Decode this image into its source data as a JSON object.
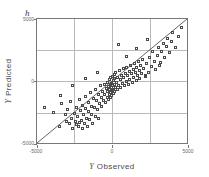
{
  "figure": {
    "panel_label": "h",
    "background_color": "#ffffff",
    "frame_color": "#777777",
    "grid_color": "#b9b9b9",
    "marker_color": "#4a4a4a",
    "line_color": "#3a3a3a"
  },
  "chart_data": {
    "type": "scatter",
    "title": "",
    "subtitle": "",
    "panel_label": "h",
    "xlabel": "Y Observed",
    "ylabel": "Y Predicted",
    "xlabel_variable": "Y",
    "xlabel_text": "Observed",
    "ylabel_variable": "Y",
    "ylabel_text": "Predicted",
    "xlim": [
      -5000,
      5000
    ],
    "ylim": [
      -5000,
      5000
    ],
    "xticks": [
      -5000,
      0,
      5000
    ],
    "yticks": [
      -5000,
      0,
      5000
    ],
    "xtick_labels": [
      "-5000",
      "0",
      "5000"
    ],
    "ytick_labels": [
      "-5000",
      "0",
      "5000"
    ],
    "grid": true,
    "gridlines_x": [
      -2500,
      0,
      2500
    ],
    "gridlines_y": [
      -2500,
      0,
      2500
    ],
    "legend": null,
    "legend_position": "none",
    "marker": "open-square",
    "reference_line": {
      "name": "one-to-one-line",
      "type": "identity",
      "slope": 1,
      "intercept": 0,
      "from": [
        -5000,
        -5000
      ],
      "to": [
        5000,
        5000
      ]
    },
    "series": [
      {
        "name": "observations",
        "points": [
          [
            -4450,
            -2100
          ],
          [
            -3850,
            -2450
          ],
          [
            -3500,
            -3550
          ],
          [
            -3350,
            -1750
          ],
          [
            -3100,
            -2600
          ],
          [
            -3050,
            -3150
          ],
          [
            -2950,
            -2200
          ],
          [
            -2800,
            -3350
          ],
          [
            -2750,
            -1600
          ],
          [
            -2700,
            -2900
          ],
          [
            -2600,
            -3700
          ],
          [
            -2500,
            -2500
          ],
          [
            -2450,
            -3150
          ],
          [
            -2400,
            -2050
          ],
          [
            -2350,
            -3450
          ],
          [
            -2300,
            -2750
          ],
          [
            -2250,
            -3600
          ],
          [
            -2200,
            -1450
          ],
          [
            -2150,
            -3250
          ],
          [
            -2100,
            -2300
          ],
          [
            -2050,
            -3100
          ],
          [
            -2000,
            -3700
          ],
          [
            -1950,
            -1900
          ],
          [
            -1900,
            -2600
          ],
          [
            -1850,
            -3350
          ],
          [
            -1800,
            -1200
          ],
          [
            -1750,
            -2150
          ],
          [
            -1700,
            -2900
          ],
          [
            -1650,
            -3550
          ],
          [
            -1600,
            -1700
          ],
          [
            -1550,
            -2400
          ],
          [
            -1500,
            -3050
          ],
          [
            -1450,
            -900
          ],
          [
            -1400,
            -1950
          ],
          [
            -1350,
            -2600
          ],
          [
            -1300,
            -3300
          ],
          [
            -1250,
            -1350
          ],
          [
            -1200,
            -2050
          ],
          [
            -1150,
            -2750
          ],
          [
            -1100,
            -600
          ],
          [
            -1050,
            -1500
          ],
          [
            -1000,
            -2200
          ],
          [
            -950,
            -2900
          ],
          [
            -900,
            -1050
          ],
          [
            -850,
            -1750
          ],
          [
            -800,
            -350
          ],
          [
            -750,
            -1250
          ],
          [
            -700,
            -1950
          ],
          [
            -650,
            -800
          ],
          [
            -600,
            -1500
          ],
          [
            -550,
            -200
          ],
          [
            -500,
            -1000
          ],
          [
            -450,
            -1700
          ],
          [
            -400,
            -550
          ],
          [
            -350,
            -1250
          ],
          [
            -320,
            -100
          ],
          [
            -300,
            -800
          ],
          [
            -280,
            -1450
          ],
          [
            -250,
            -400
          ],
          [
            -220,
            -1050
          ],
          [
            -200,
            150
          ],
          [
            -180,
            -650
          ],
          [
            -160,
            -1250
          ],
          [
            -140,
            -250
          ],
          [
            -120,
            -900
          ],
          [
            -100,
            300
          ],
          [
            -80,
            -500
          ],
          [
            -60,
            -1100
          ],
          [
            -40,
            -150
          ],
          [
            -20,
            -750
          ],
          [
            0,
            400
          ],
          [
            20,
            -350
          ],
          [
            40,
            -950
          ],
          [
            60,
            50
          ],
          [
            80,
            -600
          ],
          [
            100,
            550
          ],
          [
            120,
            -200
          ],
          [
            140,
            -800
          ],
          [
            160,
            200
          ],
          [
            180,
            -450
          ],
          [
            200,
            700
          ],
          [
            250,
            -50
          ],
          [
            300,
            -650
          ],
          [
            350,
            350
          ],
          [
            400,
            -300
          ],
          [
            450,
            850
          ],
          [
            500,
            150
          ],
          [
            550,
            -500
          ],
          [
            600,
            500
          ],
          [
            650,
            -150
          ],
          [
            700,
            1000
          ],
          [
            750,
            300
          ],
          [
            800,
            -350
          ],
          [
            850,
            650
          ],
          [
            900,
            0
          ],
          [
            950,
            1150
          ],
          [
            1000,
            450
          ],
          [
            1050,
            -200
          ],
          [
            1100,
            800
          ],
          [
            1150,
            150
          ],
          [
            1200,
            1300
          ],
          [
            1250,
            600
          ],
          [
            1300,
            -50
          ],
          [
            1350,
            950
          ],
          [
            1400,
            300
          ],
          [
            1450,
            1450
          ],
          [
            1500,
            750
          ],
          [
            1550,
            100
          ],
          [
            1600,
            1100
          ],
          [
            1650,
            450
          ],
          [
            1700,
            1600
          ],
          [
            1750,
            900
          ],
          [
            1800,
            250
          ],
          [
            1850,
            1250
          ],
          [
            1900,
            600
          ],
          [
            1950,
            1750
          ],
          [
            2050,
            1050
          ],
          [
            2150,
            400
          ],
          [
            2250,
            1400
          ],
          [
            2350,
            750
          ],
          [
            2450,
            1900
          ],
          [
            2550,
            1200
          ],
          [
            2650,
            2400
          ],
          [
            2750,
            1600
          ],
          [
            2850,
            950
          ],
          [
            2950,
            2050
          ],
          [
            3050,
            2700
          ],
          [
            3150,
            1500
          ],
          [
            3250,
            2350
          ],
          [
            3350,
            3050
          ],
          [
            3450,
            1900
          ],
          [
            3550,
            2750
          ],
          [
            3650,
            3450
          ],
          [
            3750,
            2300
          ],
          [
            3850,
            3150
          ],
          [
            3950,
            3850
          ],
          [
            4150,
            2700
          ],
          [
            4350,
            3550
          ],
          [
            4550,
            4250
          ],
          [
            400,
            2900
          ],
          [
            -1000,
            700
          ],
          [
            -1800,
            200
          ],
          [
            -2600,
            -350
          ],
          [
            -3400,
            -1150
          ],
          [
            2300,
            3300
          ],
          [
            1600,
            2600
          ],
          [
            900,
            1950
          ],
          [
            3100,
            1300
          ],
          [
            2200,
            450
          ]
        ]
      }
    ]
  },
  "axes": {
    "x_tick_label_left": "-5000",
    "x_tick_label_mid": "0",
    "x_tick_label_right": "5000",
    "y_tick_label_bottom": "-5000",
    "y_tick_label_mid": "0",
    "y_tick_label_top": "5000"
  }
}
